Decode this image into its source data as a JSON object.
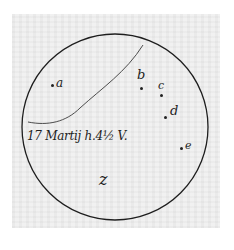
{
  "diagram": {
    "type": "telescopic-observation-sketch",
    "caption": "17 Martij h.4½ V.",
    "center_label": "z",
    "stars": [
      {
        "id": "a",
        "label": "a",
        "x": 51,
        "y": 84
      },
      {
        "id": "b",
        "label": "b",
        "x": 140,
        "y": 88
      },
      {
        "id": "c",
        "label": "c",
        "x": 160,
        "y": 94
      },
      {
        "id": "d",
        "label": "d",
        "x": 165,
        "y": 116
      },
      {
        "id": "e",
        "label": "e",
        "x": 180,
        "y": 148
      }
    ],
    "colors": {
      "ink": "#1e1e1e",
      "paper": "#ececec",
      "background": "#ffffff"
    }
  }
}
